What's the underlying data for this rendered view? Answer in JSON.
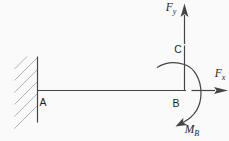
{
  "diagram": {
    "background": "#fafafa",
    "colors": {
      "line": "#454545",
      "hatch": "#b2b2b2",
      "label": "#1e1e1e"
    },
    "points": {
      "a": {
        "label": "A"
      },
      "b": {
        "label": "B"
      },
      "c": {
        "label": "C"
      }
    },
    "forces": {
      "fy": {
        "symbol": "F",
        "subscript": "y"
      },
      "fx": {
        "symbol": "F",
        "subscript": "x"
      },
      "mb": {
        "symbol": "M",
        "subscript": "B"
      }
    }
  }
}
